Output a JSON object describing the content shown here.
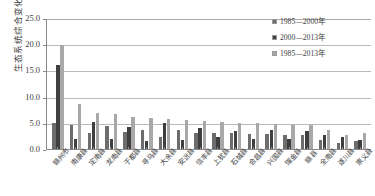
{
  "chart_data": {
    "type": "bar",
    "title": "",
    "subtitle": "",
    "xlabel": "",
    "ylabel": "生态系统综合变化率/%",
    "ylim": [
      0.0,
      25.0
    ],
    "yticks": [
      "0.0",
      "5.0",
      "10.0",
      "15.0",
      "20.0",
      "25.0"
    ],
    "ytick_values": [
      0.0,
      5.0,
      10.0,
      15.0,
      20.0,
      25.0
    ],
    "grid": true,
    "grid_axis": "y",
    "legend_position": "top-right",
    "categories": [
      "赣州市",
      "南康县",
      "定南县",
      "龙南县",
      "于都县",
      "寻乌县",
      "大余县",
      "安远县",
      "信丰县",
      "上犹县",
      "石城县",
      "会昌县",
      "兴国县",
      "瑞金县",
      "赣县",
      "全南县",
      "遂川县",
      "崇义县"
    ],
    "series": [
      {
        "name": "1985—2000年",
        "color": "#6d6d6d",
        "values": [
          5.0,
          4.5,
          3.0,
          4.3,
          3.2,
          3.7,
          2.2,
          3.6,
          3.0,
          3.0,
          3.0,
          2.9,
          2.8,
          2.7,
          2.6,
          1.8,
          1.1,
          1.5
        ]
      },
      {
        "name": "2000—2013年",
        "color": "#3f3f3f",
        "values": [
          16.0,
          2.0,
          5.2,
          1.9,
          4.2,
          1.6,
          5.0,
          1.8,
          4.0,
          2.2,
          3.5,
          1.9,
          3.6,
          1.9,
          3.5,
          2.6,
          2.2,
          1.7
        ]
      },
      {
        "name": "1985—2013年",
        "color": "#a8a8a8",
        "values": [
          19.8,
          8.6,
          6.8,
          6.6,
          6.2,
          6.0,
          5.8,
          5.6,
          5.3,
          5.2,
          5.0,
          4.9,
          4.8,
          4.6,
          4.5,
          3.6,
          2.6,
          3.0
        ]
      }
    ]
  },
  "legend": {
    "items": [
      {
        "label": "1985—2000年",
        "color": "#6d6d6d"
      },
      {
        "label": "2000—2013年",
        "color": "#3f3f3f"
      },
      {
        "label": "1985—2013年",
        "color": "#a8a8a8"
      }
    ]
  }
}
